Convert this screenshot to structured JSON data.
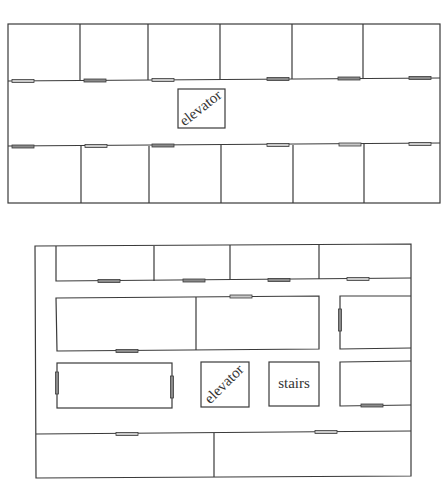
{
  "floors": [
    {
      "name": "upper-floor",
      "labels": {
        "elevator": "elevator"
      }
    },
    {
      "name": "lower-floor",
      "labels": {
        "elevator": "elevator",
        "stairs": "stairs"
      }
    }
  ],
  "colors": {
    "wall": "#3a3a3a",
    "door_fill_light": "#c8c8c8",
    "door_fill_dark": "#8a8a8a",
    "background": "#ffffff"
  }
}
